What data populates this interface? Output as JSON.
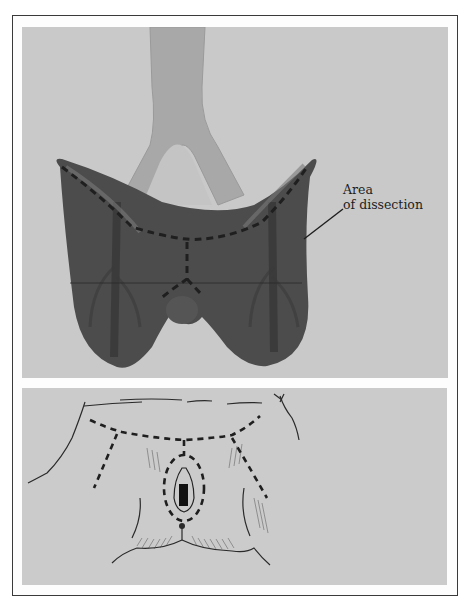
{
  "figure": {
    "panels": [
      {
        "id": "top",
        "description": "Shaded anatomical illustration of aortic bifurcation over a dark groin/perineal dissection area with dashed incision lines",
        "annotation": {
          "line1": "Area",
          "line2": "of dissection"
        }
      },
      {
        "id": "bottom",
        "description": "Line drawing of perineum with dashed incision lines around vulva and across groin"
      }
    ],
    "colors": {
      "panel_bg": "#c9c9c9",
      "dissection_area": "#4a4a4a",
      "vessel": "#a9a9a9",
      "border": "#3a3a3a",
      "ink": "#1e1e1e"
    }
  }
}
